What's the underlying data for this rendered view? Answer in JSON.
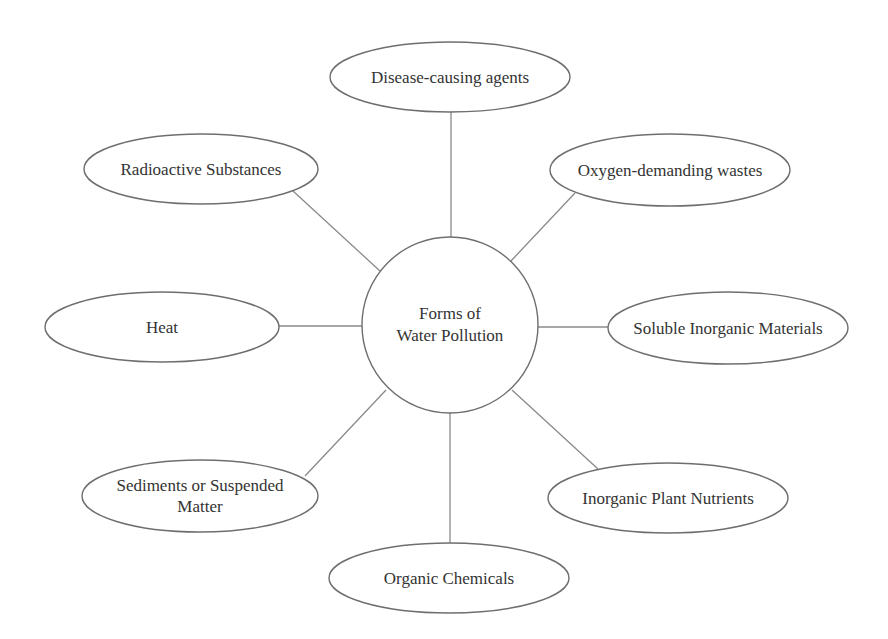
{
  "diagram": {
    "type": "mind-map",
    "center": {
      "line1": "Forms of",
      "line2": "Water Pollution",
      "cx": 450,
      "cy": 325,
      "r": 88
    },
    "nodes": [
      {
        "id": "disease",
        "line1": "Disease-causing agents",
        "line2": "",
        "cx": 450,
        "cy": 77,
        "rx": 120,
        "ry": 35
      },
      {
        "id": "radioactive",
        "line1": "Radioactive Substances",
        "line2": "",
        "cx": 201,
        "cy": 169,
        "rx": 117,
        "ry": 35
      },
      {
        "id": "oxygen",
        "line1": "Oxygen-demanding wastes",
        "line2": "",
        "cx": 670,
        "cy": 170,
        "rx": 120,
        "ry": 36
      },
      {
        "id": "heat",
        "line1": "Heat",
        "line2": "",
        "cx": 162,
        "cy": 327,
        "rx": 117,
        "ry": 35
      },
      {
        "id": "soluble",
        "line1": "Soluble Inorganic Materials",
        "line2": "",
        "cx": 728,
        "cy": 328,
        "rx": 120,
        "ry": 36
      },
      {
        "id": "sediments",
        "line1": "Sediments or Suspended",
        "line2": "Matter",
        "cx": 200,
        "cy": 496,
        "rx": 118,
        "ry": 36
      },
      {
        "id": "nutrients",
        "line1": "Inorganic Plant Nutrients",
        "line2": "",
        "cx": 668,
        "cy": 498,
        "rx": 120,
        "ry": 35
      },
      {
        "id": "organic",
        "line1": "Organic Chemicals",
        "line2": "",
        "cx": 449,
        "cy": 578,
        "rx": 120,
        "ry": 35
      }
    ],
    "connectors": [
      {
        "to": "disease",
        "x1": 451,
        "y1": 238,
        "x2": 451,
        "y2": 112
      },
      {
        "to": "radioactive",
        "x1": 380,
        "y1": 271,
        "x2": 293,
        "y2": 191
      },
      {
        "to": "oxygen",
        "x1": 510,
        "y1": 262,
        "x2": 575,
        "y2": 193
      },
      {
        "to": "heat",
        "x1": 362,
        "y1": 326,
        "x2": 279,
        "y2": 326
      },
      {
        "to": "soluble",
        "x1": 538,
        "y1": 327,
        "x2": 608,
        "y2": 327
      },
      {
        "to": "sediments",
        "x1": 386,
        "y1": 390,
        "x2": 305,
        "y2": 476
      },
      {
        "to": "nutrients",
        "x1": 512,
        "y1": 390,
        "x2": 598,
        "y2": 469
      },
      {
        "to": "organic",
        "x1": 450,
        "y1": 413,
        "x2": 450,
        "y2": 543
      }
    ]
  }
}
